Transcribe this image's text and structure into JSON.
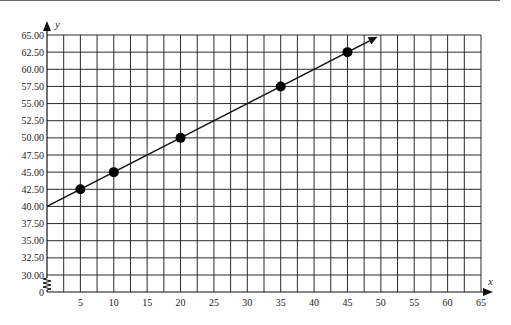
{
  "chart_data": {
    "type": "scatter",
    "title": "",
    "xlabel": "x",
    "ylabel": "y",
    "xlim": [
      0,
      65
    ],
    "ylim": [
      30,
      65
    ],
    "y_axis_break": {
      "from": 0,
      "to": 30
    },
    "grid": true,
    "x_grid_step": 2.5,
    "y_grid_step": 2.5,
    "x_tick_labels": [
      "5",
      "10",
      "15",
      "20",
      "25",
      "30",
      "35",
      "40",
      "45",
      "50",
      "55",
      "60",
      "65"
    ],
    "x_tick_values": [
      5,
      10,
      15,
      20,
      25,
      30,
      35,
      40,
      45,
      50,
      55,
      60,
      65
    ],
    "y_tick_labels": [
      "65.00",
      "62.50",
      "60.00",
      "57.50",
      "55.00",
      "52.50",
      "50.00",
      "47.50",
      "45.00",
      "42.50",
      "40.00",
      "37.50",
      "35.00",
      "32.50",
      "30.00",
      "0"
    ],
    "y_tick_values": [
      65,
      62.5,
      60,
      57.5,
      55,
      52.5,
      50,
      47.5,
      45,
      42.5,
      40,
      37.5,
      35,
      32.5,
      30,
      0
    ],
    "series": [
      {
        "name": "points",
        "type": "scatter",
        "x": [
          5,
          10,
          20,
          35,
          45
        ],
        "y": [
          42.5,
          45,
          50,
          57.5,
          62.5
        ]
      },
      {
        "name": "line",
        "type": "line",
        "equation": "y = 40 + 0.5x",
        "x": [
          0,
          49.5
        ],
        "y": [
          40,
          64.75
        ],
        "arrow_end": true
      }
    ],
    "legend": null
  },
  "colors": {
    "grid": "#2b2b2b",
    "points": "#000000",
    "line": "#111111"
  }
}
